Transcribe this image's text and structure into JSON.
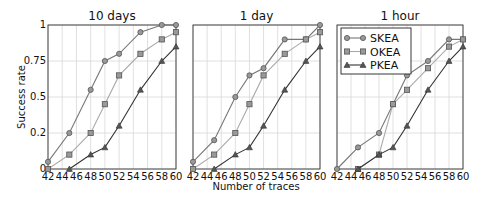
{
  "figure": {
    "xlabel": "Number of traces",
    "ylabel": "Success rate"
  },
  "legend": {
    "entries": [
      {
        "name": "SKEA",
        "marker": "circle-icon"
      },
      {
        "name": "OKEA",
        "marker": "square-icon"
      },
      {
        "name": "PKEA",
        "marker": "triangle-icon"
      }
    ],
    "position": "upper left of third panel"
  },
  "colors": {
    "SKEA": "#777777",
    "OKEA": "#aaaaaa",
    "PKEA": "#333333",
    "marker_fill": "#999999",
    "grid": "#d8d8d8",
    "axis": "#333333"
  },
  "chart_data": [
    {
      "type": "line",
      "title": "10 days",
      "xlabel": "",
      "ylabel": "Success rate",
      "x_ticks": [
        42,
        44,
        46,
        48,
        50,
        52,
        54,
        56,
        58,
        60
      ],
      "y_ticks": [
        0,
        0.25,
        0.5,
        0.75,
        1
      ],
      "y_tick_labels": [
        "0",
        "0.2",
        "0.5",
        "0.75",
        "1"
      ],
      "xlim": [
        42,
        60
      ],
      "ylim": [
        0,
        1
      ],
      "grid": true,
      "series": [
        {
          "name": "SKEA",
          "x": [
            42,
            45,
            48,
            50,
            52,
            55,
            58,
            60
          ],
          "values": [
            0.05,
            0.25,
            0.55,
            0.75,
            0.8,
            0.95,
            1.0,
            1.0
          ]
        },
        {
          "name": "OKEA",
          "x": [
            42,
            45,
            48,
            50,
            52,
            55,
            58,
            60
          ],
          "values": [
            0.0,
            0.1,
            0.25,
            0.45,
            0.65,
            0.8,
            0.9,
            0.95
          ]
        },
        {
          "name": "PKEA",
          "x": [
            45,
            48,
            50,
            52,
            55,
            58,
            60
          ],
          "values": [
            0.0,
            0.1,
            0.15,
            0.3,
            0.55,
            0.75,
            0.85
          ]
        }
      ]
    },
    {
      "type": "line",
      "title": "1 day",
      "xlabel": "Number of traces",
      "ylabel": "",
      "x_ticks": [
        42,
        44,
        46,
        48,
        50,
        52,
        54,
        56,
        58,
        60
      ],
      "y_ticks": [
        0,
        0.25,
        0.5,
        0.75,
        1
      ],
      "xlim": [
        42,
        60
      ],
      "ylim": [
        0,
        1
      ],
      "grid": true,
      "series": [
        {
          "name": "SKEA",
          "x": [
            42,
            45,
            48,
            50,
            52,
            55,
            58,
            60
          ],
          "values": [
            0.05,
            0.2,
            0.5,
            0.65,
            0.7,
            0.9,
            0.9,
            1.0
          ]
        },
        {
          "name": "OKEA",
          "x": [
            42,
            45,
            48,
            50,
            52,
            55,
            58,
            60
          ],
          "values": [
            0.0,
            0.1,
            0.25,
            0.45,
            0.65,
            0.8,
            0.9,
            0.95
          ]
        },
        {
          "name": "PKEA",
          "x": [
            45,
            48,
            50,
            52,
            55,
            58,
            60
          ],
          "values": [
            0.0,
            0.1,
            0.15,
            0.3,
            0.55,
            0.75,
            0.85
          ]
        }
      ]
    },
    {
      "type": "line",
      "title": "1 hour",
      "xlabel": "",
      "ylabel": "",
      "x_ticks": [
        42,
        44,
        46,
        48,
        50,
        52,
        54,
        56,
        58,
        60
      ],
      "y_ticks": [
        0,
        0.25,
        0.5,
        0.75,
        1
      ],
      "xlim": [
        42,
        60
      ],
      "ylim": [
        0,
        1
      ],
      "grid": true,
      "series": [
        {
          "name": "SKEA",
          "x": [
            42,
            45,
            48,
            50,
            52,
            55,
            58,
            60
          ],
          "values": [
            0.0,
            0.15,
            0.25,
            0.45,
            0.65,
            0.75,
            0.9,
            0.9
          ]
        },
        {
          "name": "OKEA",
          "x": [
            45,
            48,
            50,
            52,
            55,
            58,
            60
          ],
          "values": [
            0.0,
            0.1,
            0.45,
            0.55,
            0.7,
            0.85,
            0.9
          ]
        },
        {
          "name": "PKEA",
          "x": [
            45,
            48,
            50,
            52,
            55,
            58,
            60
          ],
          "values": [
            0.0,
            0.1,
            0.15,
            0.3,
            0.55,
            0.75,
            0.85
          ]
        }
      ]
    }
  ]
}
